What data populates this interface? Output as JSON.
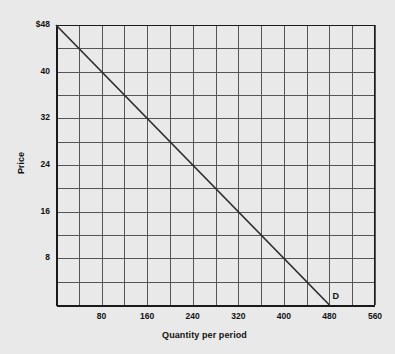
{
  "chart_data": {
    "type": "line",
    "title": "",
    "xlabel": "Quantity per period",
    "ylabel": "Price",
    "xlim": [
      0,
      560
    ],
    "ylim": [
      0,
      48
    ],
    "grid": true,
    "grid_x_step": 40,
    "grid_y_step": 4,
    "xticks": [
      80,
      160,
      240,
      320,
      400,
      480,
      560
    ],
    "xtick_labels": [
      "80",
      "160",
      "240",
      "320",
      "400",
      "480",
      "560"
    ],
    "yticks": [
      8,
      16,
      24,
      32,
      40,
      48
    ],
    "ytick_labels": [
      "8",
      "16",
      "24",
      "32",
      "40",
      "$48"
    ],
    "legend_position": "inline-end-of-line",
    "series": [
      {
        "name": "D",
        "label": "D",
        "type": "line",
        "color": "#2d2d2d",
        "points": [
          {
            "x": 0,
            "y": 48
          },
          {
            "x": 480,
            "y": 0
          }
        ],
        "annotation": "D"
      }
    ]
  },
  "colors": {
    "background": "#e9e9e9",
    "grid": "#555555",
    "axis": "#1a1a1a",
    "line": "#2d2d2d",
    "text": "#111111"
  }
}
